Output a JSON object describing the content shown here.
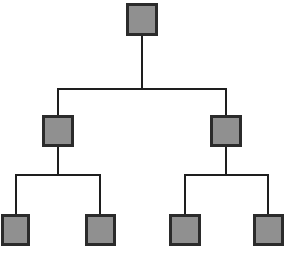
{
  "diagram": {
    "type": "tree",
    "background_color": "#ffffff",
    "node_fill_color": "#909090",
    "node_border_color": "#2b2b2b",
    "connector_color": "#1e1e1e",
    "node_border_width": 3,
    "connector_width": 2,
    "levels": 3,
    "node_count": 7,
    "nodes": [
      {
        "id": "root",
        "label": "",
        "level": 0,
        "x": 126,
        "y": 3,
        "width": 32,
        "height": 33,
        "name": "tree-node-root"
      },
      {
        "id": "n-left",
        "label": "",
        "level": 1,
        "x": 42,
        "y": 115,
        "width": 32,
        "height": 32,
        "name": "tree-node-left-branch"
      },
      {
        "id": "n-right",
        "label": "",
        "level": 1,
        "x": 210,
        "y": 115,
        "width": 32,
        "height": 32,
        "name": "tree-node-right-branch"
      },
      {
        "id": "leaf-1",
        "label": "",
        "level": 2,
        "x": 1,
        "y": 214,
        "width": 29,
        "height": 32,
        "name": "tree-node-leaf-1"
      },
      {
        "id": "leaf-2",
        "label": "",
        "level": 2,
        "x": 85,
        "y": 214,
        "width": 31,
        "height": 32,
        "name": "tree-node-leaf-2"
      },
      {
        "id": "leaf-3",
        "label": "",
        "level": 2,
        "x": 169,
        "y": 214,
        "width": 32,
        "height": 32,
        "name": "tree-node-leaf-3"
      },
      {
        "id": "leaf-4",
        "label": "",
        "level": 2,
        "x": 253,
        "y": 214,
        "width": 31,
        "height": 32,
        "name": "tree-node-leaf-4"
      }
    ],
    "edges": [
      {
        "id": "edge-root-stem",
        "from": "root",
        "to": "level-1-bus",
        "points": "142,36 142,89",
        "name": "connector-root-stem"
      },
      {
        "id": "edge-level1-bus",
        "from": "level-1-bus-left",
        "to": "level-1-bus-right",
        "points": "57,89 227,89",
        "name": "connector-level-1-bus"
      },
      {
        "id": "edge-bus-left-drop",
        "from": "level-1-bus",
        "to": "n-left",
        "points": "58,89 58,115",
        "name": "connector-left-branch-drop"
      },
      {
        "id": "edge-bus-right-drop",
        "from": "level-1-bus",
        "to": "n-right",
        "points": "226,89 226,115",
        "name": "connector-right-branch-drop"
      },
      {
        "id": "edge-left-stem",
        "from": "n-left",
        "to": "level-2-left-bus",
        "points": "58,147 58,175",
        "name": "connector-left-branch-stem"
      },
      {
        "id": "edge-level2-left-bus",
        "from": "leaf-1",
        "to": "leaf-2",
        "points": "15,175 101,175",
        "name": "connector-level-2-left-bus"
      },
      {
        "id": "edge-leaf1-drop",
        "from": "level-2-left-bus",
        "to": "leaf-1",
        "points": "16,175 16,214",
        "name": "connector-leaf-1-drop"
      },
      {
        "id": "edge-leaf2-drop",
        "from": "level-2-left-bus",
        "to": "leaf-2",
        "points": "100,175 100,214",
        "name": "connector-leaf-2-drop"
      },
      {
        "id": "edge-right-stem",
        "from": "n-right",
        "to": "level-2-right-bus",
        "points": "226,147 226,175",
        "name": "connector-right-branch-stem"
      },
      {
        "id": "edge-level2-right-bus",
        "from": "leaf-3",
        "to": "leaf-4",
        "points": "184,175 269,175",
        "name": "connector-level-2-right-bus"
      },
      {
        "id": "edge-leaf3-drop",
        "from": "level-2-right-bus",
        "to": "leaf-3",
        "points": "185,175 185,214",
        "name": "connector-leaf-3-drop"
      },
      {
        "id": "edge-leaf4-drop",
        "from": "level-2-right-bus",
        "to": "leaf-4",
        "points": "268,175 268,214",
        "name": "connector-leaf-4-drop"
      }
    ]
  }
}
